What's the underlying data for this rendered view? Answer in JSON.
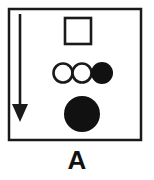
{
  "figure": {
    "panel_label": "A",
    "canvas": {
      "width": 154,
      "height": 180
    },
    "colors": {
      "background": "#ffffff",
      "stroke": "#1a1a1a",
      "fill_solid": "#111111",
      "fill_open": "#ffffff",
      "label": "#111111"
    },
    "frame": {
      "name": "panel-border",
      "x": 9,
      "y": 9,
      "width": 132,
      "height": 131,
      "stroke_width": 2.5,
      "fill": "none"
    },
    "arrow": {
      "name": "downward-arrow",
      "direction": "down",
      "shaft_x": 20,
      "shaft_top_y": 14,
      "shaft_bottom_y": 106,
      "shaft_width": 2.5,
      "head_left_x": 12,
      "head_right_x": 28,
      "head_top_y": 104,
      "head_tip_y": 122
    },
    "shapes": [
      {
        "name": "open-square",
        "type": "square",
        "fill": "open",
        "x": 65,
        "y": 18,
        "width": 26,
        "height": 26,
        "stroke_width": 2.5
      },
      {
        "name": "open-circle-left",
        "type": "circle",
        "fill": "open",
        "cx": 63,
        "cy": 73,
        "r": 10,
        "stroke_width": 2.5
      },
      {
        "name": "open-circle-middle",
        "type": "circle",
        "fill": "open",
        "cx": 82,
        "cy": 73,
        "r": 10,
        "stroke_width": 2.5
      },
      {
        "name": "filled-circle-right",
        "type": "circle",
        "fill": "solid",
        "cx": 102,
        "cy": 73,
        "r": 11,
        "stroke_width": 0
      },
      {
        "name": "filled-circle-large",
        "type": "circle",
        "fill": "solid",
        "cx": 82,
        "cy": 114,
        "r": 18,
        "stroke_width": 0
      }
    ]
  }
}
